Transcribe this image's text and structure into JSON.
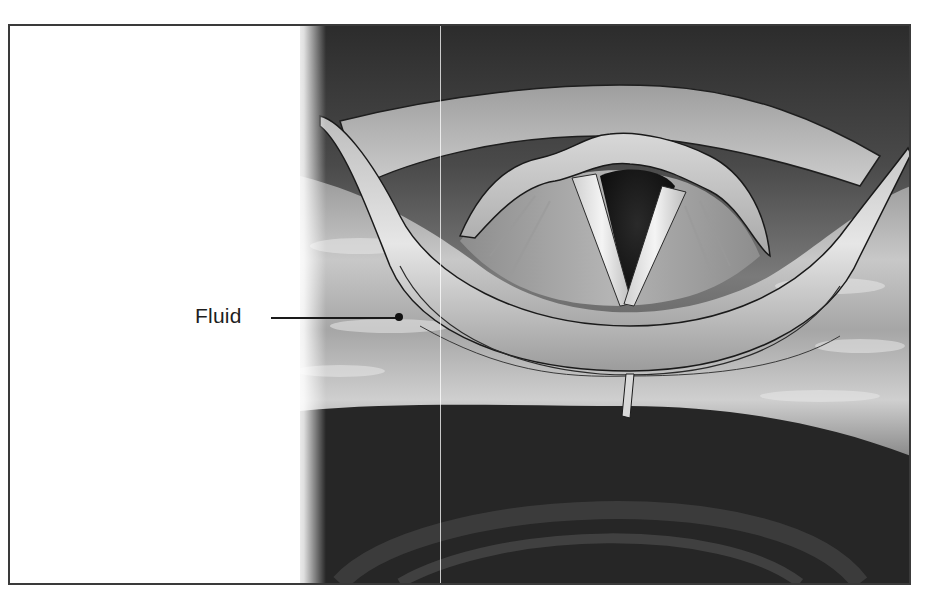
{
  "figure": {
    "labels": [
      {
        "text": "Fluid",
        "pointer": "leader-line-with-dot"
      }
    ],
    "style": "grayscale anatomical illustration",
    "colors": {
      "border": "#3a3a3a",
      "background": "#ffffff",
      "tissue_dark": "#2e2e2e",
      "tissue_mid": "#8c8c8c",
      "tissue_light": "#d6d6d6",
      "cords": "#e8e8e8",
      "airway": "#141414"
    }
  }
}
